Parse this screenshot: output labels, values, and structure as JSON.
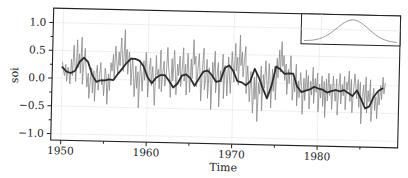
{
  "chart_data": {
    "type": "line",
    "title": "",
    "xlabel": "Time",
    "ylabel": "soi",
    "xlim": [
      1948.5,
      1989
    ],
    "ylim": [
      -1.1,
      1.2
    ],
    "x_ticks": [
      1950,
      1960,
      1970,
      1980
    ],
    "x_tick_labels": [
      "1950",
      "1960",
      "1970",
      "1980"
    ],
    "y_ticks": [
      -1.0,
      -0.5,
      0.0,
      0.5,
      1.0
    ],
    "y_tick_labels": [
      "−1.0",
      "−0.5",
      "0.0",
      "0.5",
      "1.0"
    ],
    "grid": true,
    "series": [
      {
        "name": "soi (monthly, raw)",
        "style": "thin gray line",
        "color": "#8a8a8a",
        "x_start": 1950.0,
        "x_step": 0.0833,
        "note": "monthly Southern Oscillation Index, values oscillate roughly between -1.0 and 1.0"
      },
      {
        "name": "soi (smoothed)",
        "style": "thick dark line",
        "color": "#2b2b2b",
        "x": [
          1950.0,
          1950.5,
          1951.0,
          1951.5,
          1952.0,
          1952.5,
          1953.0,
          1953.5,
          1954.0,
          1954.5,
          1955.0,
          1955.5,
          1956.0,
          1956.5,
          1957.0,
          1957.5,
          1958.0,
          1958.5,
          1959.0,
          1959.5,
          1960.0,
          1960.5,
          1961.0,
          1961.5,
          1962.0,
          1962.5,
          1963.0,
          1963.5,
          1964.0,
          1964.5,
          1965.0,
          1965.5,
          1966.0,
          1966.5,
          1967.0,
          1967.5,
          1968.0,
          1968.5,
          1969.0,
          1969.5,
          1970.0,
          1970.5,
          1971.0,
          1971.5,
          1972.0,
          1972.5,
          1973.0,
          1973.5,
          1974.0,
          1974.5,
          1975.0,
          1975.5,
          1976.0,
          1976.5,
          1977.0,
          1977.5,
          1978.0,
          1978.5,
          1979.0,
          1979.5,
          1980.0,
          1980.5,
          1981.0,
          1981.5,
          1982.0,
          1982.5,
          1983.0,
          1983.5,
          1984.0,
          1984.5,
          1985.0,
          1985.5,
          1986.0,
          1986.5,
          1987.0,
          1987.5
        ],
        "y": [
          0.2,
          0.12,
          0.1,
          0.14,
          0.3,
          0.38,
          0.3,
          0.08,
          -0.05,
          -0.02,
          -0.02,
          0.0,
          -0.01,
          0.1,
          0.2,
          0.3,
          0.38,
          0.38,
          0.35,
          0.25,
          0.05,
          -0.05,
          0.05,
          0.1,
          0.1,
          0.0,
          -0.12,
          -0.05,
          0.1,
          0.12,
          0.05,
          -0.08,
          0.05,
          0.18,
          0.2,
          0.12,
          0.0,
          0.02,
          0.25,
          0.3,
          0.2,
          0.02,
          0.0,
          -0.05,
          0.02,
          0.25,
          0.1,
          -0.1,
          -0.28,
          -0.05,
          0.3,
          0.25,
          0.17,
          0.18,
          0.18,
          -0.05,
          -0.15,
          -0.12,
          -0.1,
          -0.05,
          -0.08,
          -0.1,
          -0.15,
          -0.12,
          -0.1,
          -0.12,
          -0.1,
          -0.15,
          -0.2,
          -0.1,
          -0.25,
          -0.42,
          -0.38,
          -0.2,
          -0.1,
          -0.05
        ]
      }
    ],
    "raw_y": [
      0.3,
      0.15,
      0.05,
      0.25,
      -0.05,
      0.2,
      0.1,
      -0.1,
      0.35,
      0.05,
      0.6,
      0.3,
      -0.05,
      0.7,
      0.2,
      0.45,
      0.1,
      0.75,
      -0.1,
      0.3,
      0.55,
      0.15,
      -0.15,
      0.1,
      -0.35,
      0.0,
      0.2,
      -0.25,
      0.15,
      -0.4,
      0.1,
      0.25,
      -0.2,
      0.05,
      0.3,
      -0.1,
      0.0,
      -0.3,
      0.2,
      0.05,
      -0.45,
      0.1,
      -0.2,
      0.3,
      0.15,
      0.45,
      0.0,
      0.6,
      0.35,
      0.1,
      0.5,
      0.25,
      0.75,
      0.4,
      0.15,
      0.9,
      0.3,
      0.55,
      0.1,
      0.5,
      0.35,
      -0.1,
      0.4,
      0.1,
      -0.3,
      0.25,
      -0.15,
      0.15,
      -0.5,
      0.3,
      0.1,
      -0.2,
      0.35,
      0.0,
      0.5,
      0.15,
      -0.3,
      0.2,
      0.4,
      -0.1,
      0.25,
      -0.05,
      -0.45,
      0.45,
      0.1,
      0.2,
      -0.15,
      0.55,
      -0.2,
      0.15,
      0.35,
      -0.1,
      0.1,
      0.6,
      0.25,
      0.05,
      -0.3,
      0.4,
      0.0,
      0.55,
      0.2,
      -0.25,
      0.3,
      0.1,
      0.45,
      -0.1,
      0.2,
      0.6,
      0.0,
      0.3,
      -0.25,
      0.5,
      0.15,
      -0.2,
      0.4,
      0.05,
      0.75,
      0.3,
      0.45,
      -0.1,
      0.2,
      0.5,
      0.1,
      -0.35,
      0.25,
      0.6,
      -0.15,
      0.05,
      0.4,
      -0.3,
      0.25,
      0.1,
      -0.5,
      0.35,
      0.05,
      0.55,
      -0.2,
      0.1,
      0.35,
      -0.45,
      0.2,
      0.0,
      0.5,
      -0.3,
      0.3,
      0.15,
      -0.25,
      0.45,
      0.1,
      -0.2,
      0.55,
      0.3,
      0.0,
      0.7,
      0.2,
      0.45,
      -0.05,
      0.85,
      0.3,
      0.55,
      0.1,
      0.4,
      0.65,
      -0.2,
      0.3,
      0.0,
      -0.35,
      0.2,
      -0.1,
      -0.55,
      0.1,
      -0.3,
      0.2,
      -0.7,
      0.0,
      -0.2,
      0.3,
      -0.5,
      0.15,
      -0.1,
      0.4,
      0.1,
      -0.25,
      0.35,
      0.05,
      -0.45,
      0.25,
      -0.15,
      0.3,
      -0.3,
      0.45,
      0.1,
      0.6,
      0.2,
      0.75,
      0.3,
      0.5,
      0.05,
      0.35,
      -0.2,
      0.25,
      0.0,
      0.5,
      0.15,
      -0.3,
      0.1,
      -0.15,
      0.35,
      -0.4,
      0.05,
      -0.25,
      0.2,
      -0.05,
      -0.55,
      0.1,
      -0.3,
      0.25,
      -0.1,
      0.15,
      -0.45,
      0.05,
      -0.2,
      0.3,
      -0.35,
      0.1,
      -0.15,
      0.2,
      -0.5,
      0.0,
      -0.25,
      0.15,
      -0.4,
      0.05,
      -0.6,
      0.1,
      -0.3,
      0.2,
      -0.2,
      0.0,
      -0.45,
      0.15,
      -0.1,
      -0.3,
      0.1,
      -0.55,
      -0.05,
      0.2,
      -0.35,
      0.0,
      -0.2,
      0.15,
      -0.45,
      0.05,
      -0.1,
      0.25,
      -0.3,
      0.1,
      -0.5,
      -0.15,
      0.2,
      0.0,
      -0.25,
      0.1,
      -0.4,
      0.05,
      -0.7,
      -0.2,
      0.0,
      -0.35,
      0.15,
      -0.5,
      -0.1,
      -0.3,
      0.1,
      -0.65,
      -0.25,
      -0.05,
      -0.45,
      -0.2,
      -0.6,
      -0.1,
      -0.35,
      0.0,
      -0.25,
      0.15,
      -0.15,
      0.05
    ],
    "inset": {
      "type": "line",
      "shape": "bell-shaped density curve",
      "color": "#8a8a8a",
      "grid": true
    }
  }
}
